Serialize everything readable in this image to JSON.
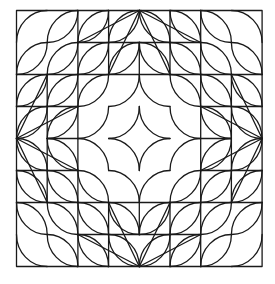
{
  "figure": {
    "colors": {
      "background": "#ffffff",
      "stroke": "#1a1a1a"
    },
    "grid": {
      "cells": 8,
      "origin_px": [
        16.5,
        10.5
      ],
      "cell_w_px": 30.7,
      "cell_h_px": 32.0
    },
    "outer_square": [
      0,
      0,
      8,
      8
    ],
    "full_lines": [
      [
        2,
        0,
        2,
        8
      ],
      [
        6,
        0,
        6,
        8
      ],
      [
        0,
        2,
        8,
        2
      ],
      [
        0,
        6,
        8,
        6
      ]
    ],
    "house_top_lines": [
      [
        4,
        0,
        2,
        1
      ],
      [
        4,
        0,
        6,
        1
      ],
      [
        4,
        0,
        3,
        2
      ],
      [
        4,
        0,
        5,
        2
      ],
      [
        3,
        0,
        3,
        2
      ],
      [
        5,
        0,
        5,
        2
      ],
      [
        2,
        1,
        6,
        1
      ],
      [
        4,
        1,
        4,
        2
      ]
    ],
    "house_rotations": 4,
    "leaf_orientation_by_quadrant": {
      "top_left": "/",
      "top_right": "\\",
      "bottom_left": "\\",
      "bottom_right": "/"
    },
    "leaf_excluded_cells": [
      [
        3,
        3
      ],
      [
        4,
        3
      ],
      [
        3,
        4
      ],
      [
        4,
        4
      ],
      [
        3,
        2
      ],
      [
        4,
        2
      ],
      [
        5,
        3
      ],
      [
        5,
        4
      ],
      [
        3,
        5
      ],
      [
        4,
        5
      ],
      [
        2,
        3
      ],
      [
        2,
        4
      ]
    ],
    "corner_single_arc_cells": [
      [
        0,
        0
      ],
      [
        7,
        0
      ],
      [
        0,
        7
      ],
      [
        7,
        7
      ]
    ],
    "astroid_centers": [
      [
        3,
        3
      ],
      [
        5,
        3
      ],
      [
        5,
        5
      ],
      [
        3,
        5
      ]
    ],
    "astroid_tips": [
      [
        4,
        3
      ],
      [
        5,
        4
      ],
      [
        4,
        5
      ],
      [
        3,
        4
      ]
    ],
    "ring_cusps": [
      {
        "tip": [
          4,
          2
        ],
        "arcs": [
          {
            "c": [
              3,
              2
            ],
            "to": [
              3,
              3
            ]
          },
          {
            "c": [
              5,
              2
            ],
            "to": [
              5,
              3
            ]
          }
        ]
      },
      {
        "tip": [
          6,
          4
        ],
        "arcs": [
          {
            "c": [
              6,
              3
            ],
            "to": [
              5,
              3
            ]
          },
          {
            "c": [
              6,
              5
            ],
            "to": [
              5,
              5
            ]
          }
        ]
      },
      {
        "tip": [
          4,
          6
        ],
        "arcs": [
          {
            "c": [
              3,
              6
            ],
            "to": [
              3,
              5
            ]
          },
          {
            "c": [
              5,
              6
            ],
            "to": [
              5,
              5
            ]
          }
        ]
      },
      {
        "tip": [
          2,
          4
        ],
        "arcs": [
          {
            "c": [
              2,
              3
            ],
            "to": [
              3,
              3
            ]
          },
          {
            "c": [
              2,
              5
            ],
            "to": [
              3,
              5
            ]
          }
        ]
      }
    ]
  }
}
